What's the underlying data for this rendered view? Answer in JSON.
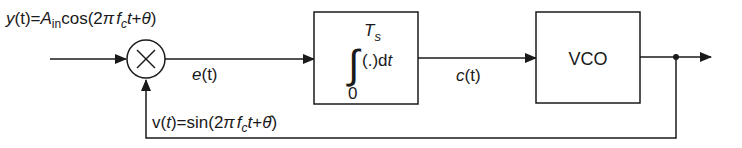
{
  "diagram": {
    "type": "block-diagram",
    "input_label": {
      "lhs": "y",
      "arg": "(t)",
      "eq": "=",
      "amp": "A",
      "amp_sub": "in",
      "func": "cos(2",
      "pi": "π",
      "f": "f",
      "f_sub": "c",
      "t": "t",
      "plus": "+",
      "theta": "θ",
      "close": ")"
    },
    "multiplier": {
      "symbol": "×",
      "name": "multiplier"
    },
    "error_label": {
      "name": "e",
      "arg": "(t)"
    },
    "integrator": {
      "upper_limit": "T",
      "upper_limit_sub": "s",
      "lower_limit": "0",
      "integral_sign": "∫",
      "integrand": "(.)d",
      "var": "t"
    },
    "control_label": {
      "name": "c",
      "arg": "(t)"
    },
    "vco": {
      "label": "VCO"
    },
    "feedback_label": {
      "lhs": "v(",
      "t": "t",
      "mid": ")=sin(2",
      "pi": "π",
      "f": "f",
      "f_sub": "c",
      "t2": "t",
      "plus": "+",
      "theta_hat": "θ̂",
      "close": ")"
    },
    "colors": {
      "stroke": "#1a1a1a",
      "background": "#ffffff"
    }
  }
}
